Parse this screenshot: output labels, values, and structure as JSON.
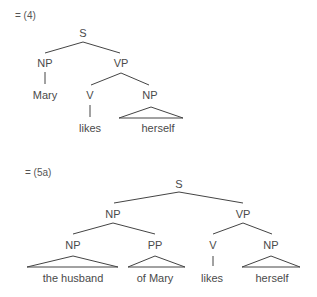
{
  "diagram_4": {
    "label": "= (4)",
    "nodes": {
      "s": "S",
      "np": "NP",
      "vp": "VP",
      "mary": "Mary",
      "v": "V",
      "np2": "NP",
      "likes": "likes",
      "herself": "herself"
    }
  },
  "diagram_5a": {
    "label": "= (5a)",
    "nodes": {
      "s": "S",
      "np": "NP",
      "vp": "VP",
      "np_inner": "NP",
      "pp": "PP",
      "v": "V",
      "np_obj": "NP",
      "the_husband": "the husband",
      "of_mary": "of Mary",
      "likes": "likes",
      "herself": "herself"
    }
  },
  "colors": {
    "line": "#444444",
    "text": "#4a4a4a"
  }
}
